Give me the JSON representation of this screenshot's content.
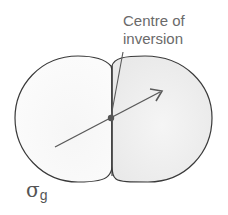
{
  "diagram": {
    "title": "",
    "labels": {
      "centre_line1": "Centre of",
      "centre_line2": "inversion",
      "symmetry_symbol": "σ",
      "symmetry_subscript": "g"
    },
    "colors": {
      "outline": "#3a3a3a",
      "fill": "#f1f1f1",
      "arrow": "#5a5a5a",
      "dot": "#555555",
      "text": "#6a6a6a"
    }
  }
}
